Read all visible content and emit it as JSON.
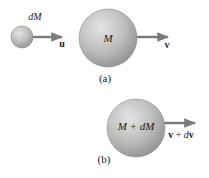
{
  "figure": {
    "panel_a": {
      "caption": "(a)",
      "small_mass": {
        "label": "dM"
      },
      "small_velocity": {
        "label": "u"
      },
      "large_mass": {
        "label": "M"
      },
      "large_velocity": {
        "label": "v"
      }
    },
    "panel_b": {
      "caption": "(b)",
      "combined_mass": {
        "label": "M + dM"
      },
      "combined_velocity": {
        "label_bold_1": "v",
        "label_sep": " + ",
        "label_italic": "d",
        "label_bold_2": "v"
      }
    }
  },
  "colors": {
    "sphere_light": "#e2e2e2",
    "sphere_mid": "#b8b8b8",
    "sphere_dark": "#8f8f8f",
    "arrow": "#7a7a7a",
    "text": "#1a1a1a"
  }
}
